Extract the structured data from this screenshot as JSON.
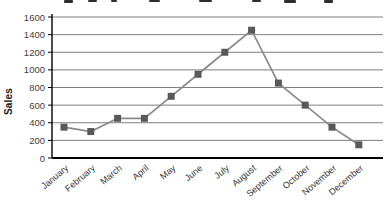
{
  "chart_data": {
    "type": "line",
    "categories": [
      "January",
      "February",
      "March",
      "April",
      "May",
      "June",
      "July",
      "August",
      "September",
      "October",
      "November",
      "December"
    ],
    "series": [
      {
        "name": "Sales",
        "values": [
          350,
          300,
          450,
          450,
          700,
          950,
          1200,
          1450,
          850,
          600,
          350,
          150
        ]
      }
    ],
    "xlabel": "",
    "ylabel": "Sales",
    "ylim": [
      0,
      1600
    ],
    "yticks": [
      0,
      200,
      400,
      600,
      800,
      1000,
      1200,
      1400,
      1600
    ],
    "grid": true,
    "legend": false,
    "marker": "square",
    "title_note": "",
    "colors": {
      "line": "#8a8a8a",
      "marker": "#595959",
      "grid": "#7f7f7f",
      "axis": "#000000",
      "y_tick_label": "#404040",
      "x_tick_label": "#333333"
    }
  }
}
